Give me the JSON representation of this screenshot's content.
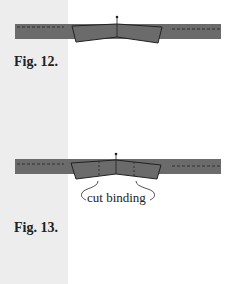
{
  "figures": [
    {
      "label": "Fig. 12."
    },
    {
      "label": "Fig. 13.",
      "annotation": "cut binding"
    }
  ],
  "colors": {
    "strip": "#6b6b6b",
    "margin": "#ededed",
    "outline": "#222222"
  }
}
